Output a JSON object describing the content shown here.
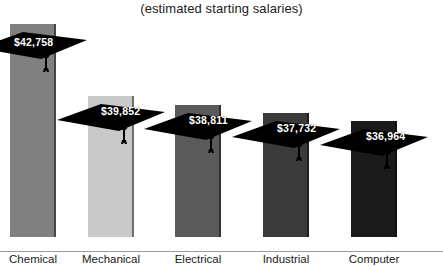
{
  "chart_data": {
    "type": "bar",
    "title": "(estimated starting salaries)",
    "xlabel": "",
    "ylabel": "",
    "grid": false,
    "legend": "none",
    "categories": [
      "Chemical",
      "Mechanical",
      "Electrical",
      "Industrial",
      "Computer"
    ],
    "values": [
      42758,
      39852,
      38811,
      37732,
      36964
    ],
    "value_labels": [
      "$42,758",
      "$39,852",
      "$38,811",
      "$37,732",
      "$36,964"
    ],
    "ylim": [
      0,
      45000
    ],
    "bar_colors": [
      "#808080",
      "#c9c9c9",
      "#5a5a5a",
      "#3a3a3a",
      "#1a1a1a"
    ],
    "marker": "graduation-cap"
  },
  "chart": {
    "title": "(estimated starting salaries)",
    "bars": [
      {
        "category": "Chemical",
        "value_label": "$42,758",
        "value": 42758,
        "color": "#808080",
        "noise": false,
        "left": 10,
        "width": 46,
        "height": 213,
        "cap_top": 26,
        "label_x": 14,
        "label_y": 36
      },
      {
        "category": "Mechanical",
        "value_label": "$39,852",
        "value": 39852,
        "color": "#c9c9c9",
        "noise": false,
        "left": 88,
        "width": 46,
        "height": 141,
        "cap_top": 98,
        "label_x": 101,
        "label_y": 105
      },
      {
        "category": "Electrical",
        "value_label": "$38,811",
        "value": 38811,
        "color": "#5a5a5a",
        "noise": true,
        "left": 175,
        "width": 46,
        "height": 132,
        "cap_top": 107,
        "label_x": 189,
        "label_y": 114
      },
      {
        "category": "Industrial",
        "value_label": "$37,732",
        "value": 37732,
        "color": "#3a3a3a",
        "noise": true,
        "left": 263,
        "width": 46,
        "height": 124,
        "cap_top": 115,
        "label_x": 277,
        "label_y": 122
      },
      {
        "category": "Computer",
        "value_label": "$36,964",
        "value": 36964,
        "color": "#1a1a1a",
        "noise": true,
        "left": 351,
        "width": 46,
        "height": 116,
        "cap_top": 123,
        "label_x": 366,
        "label_y": 130
      }
    ]
  }
}
